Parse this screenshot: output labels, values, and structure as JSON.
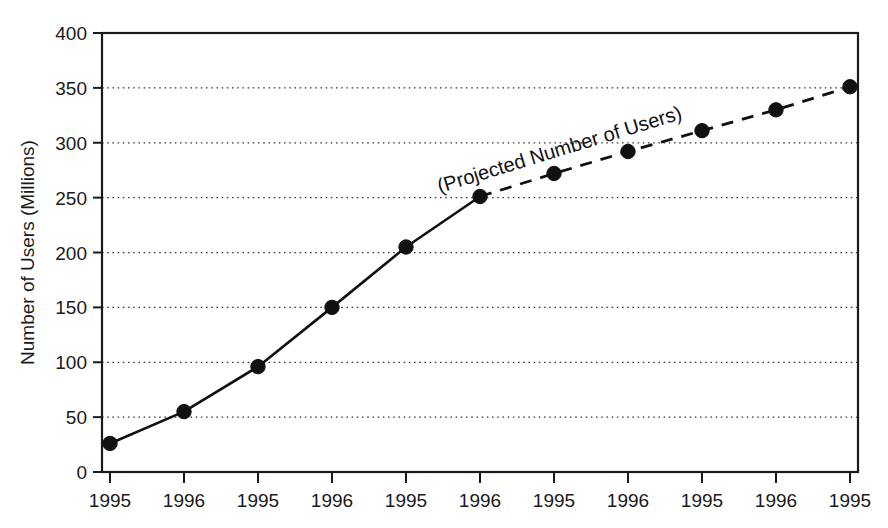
{
  "chart_data": {
    "type": "line",
    "title": "",
    "xlabel": "",
    "ylabel": "Number of Users (Millions)",
    "ylim": [
      0,
      400
    ],
    "yticks": [
      0,
      50,
      100,
      150,
      200,
      250,
      300,
      350,
      400
    ],
    "ytick_labels": [
      "0",
      "50",
      "100",
      "150",
      "200",
      "250",
      "300",
      "350",
      "400"
    ],
    "categories": [
      "1995",
      "1996",
      "1995",
      "1996",
      "1995",
      "1996",
      "1995",
      "1996",
      "1995",
      "1996",
      "1995"
    ],
    "xtick_labels": [
      "1995",
      "1996",
      "1995",
      "1996",
      "1995",
      "1996",
      "1995",
      "1996",
      "1995",
      "1996",
      "1995"
    ],
    "grid": "horizontal-dotted",
    "legend": "none",
    "series": [
      {
        "name": "Number of Users",
        "style": "solid",
        "x": [
          "1995",
          "1996",
          "1995",
          "1996",
          "1995",
          "1996"
        ],
        "x_index": [
          0,
          1,
          2,
          3,
          4,
          5
        ],
        "values": [
          26,
          55,
          96,
          150,
          205,
          251
        ]
      },
      {
        "name": "Projected Number of Users",
        "style": "dashed",
        "x": [
          "1996",
          "1995",
          "1996",
          "1995",
          "1996",
          "1995"
        ],
        "x_index": [
          5,
          6,
          7,
          8,
          9,
          10
        ],
        "values": [
          251,
          272,
          292,
          311,
          330,
          351
        ]
      }
    ],
    "annotations": [
      {
        "text": "(Projected Number of Users)",
        "rotation_deg": -17,
        "anchor_x_index": 6.1,
        "anchor_value": 288
      }
    ]
  },
  "axes": {
    "y_axis_title": "Number of Users (Millions)"
  },
  "colors": {
    "line": "#111111",
    "marker": "#111111",
    "grid": "#3a3a3a",
    "axis": "#1a1a1a",
    "background": "#ffffff"
  }
}
